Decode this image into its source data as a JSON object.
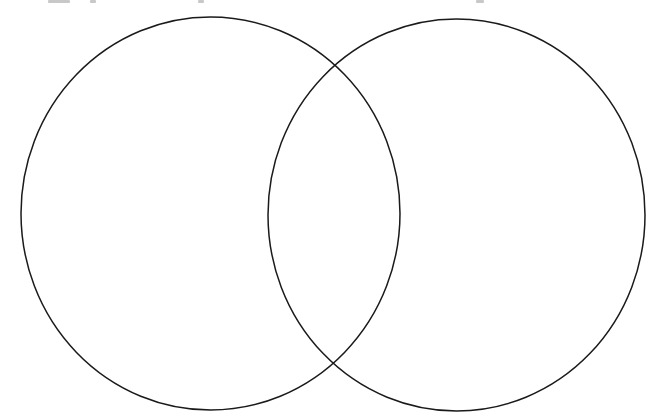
{
  "diagram": {
    "type": "venn",
    "set_count": 2,
    "stroke_color": "#1a1a1a",
    "stroke_width": 1.5,
    "fill": "none",
    "background": "#ffffff",
    "circles": [
      {
        "id": "left",
        "cx": 210.5,
        "cy": 213.5,
        "rx": 189.5,
        "ry": 196.5,
        "label": ""
      },
      {
        "id": "right",
        "cx": 456.5,
        "cy": 215,
        "rx": 188.5,
        "ry": 196,
        "label": ""
      }
    ],
    "intersections": [
      {
        "x": 334,
        "y": 65
      },
      {
        "x": 334,
        "y": 363
      }
    ]
  }
}
